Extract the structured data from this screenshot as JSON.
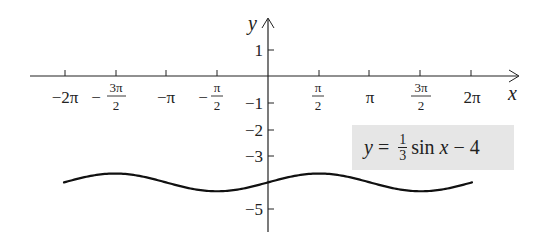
{
  "chart_data": {
    "type": "line",
    "title": "",
    "function": "y = (1/3) sin x - 4",
    "xlabel": "x",
    "ylabel": "y",
    "x_ticks": [
      "-2π",
      "-3π/2",
      "-π",
      "-π/2",
      "π/2",
      "π",
      "3π/2",
      "2π"
    ],
    "x_tick_values": [
      -6.2832,
      -4.7124,
      -3.1416,
      -1.5708,
      1.5708,
      3.1416,
      4.7124,
      6.2832
    ],
    "y_ticks": [
      "1",
      "-1",
      "-2",
      "-3",
      "-5"
    ],
    "y_tick_values": [
      1,
      -1,
      -2,
      -3,
      -5
    ],
    "xlim": [
      -6.6,
      7.5
    ],
    "ylim": [
      -5.8,
      1.7
    ],
    "grid": false,
    "series": [
      {
        "name": "y = 1/3 sin x - 4",
        "x": [
          -6.2832,
          -4.7124,
          -3.1416,
          -1.5708,
          0,
          1.5708,
          3.1416,
          4.7124,
          6.2832
        ],
        "y": [
          -4,
          -3.667,
          -4,
          -4.333,
          -4,
          -3.667,
          -4,
          -4.333,
          -4
        ],
        "color": "#111111"
      }
    ],
    "annotation": {
      "text": "y = 1/3 sin x − 4",
      "background": "#e6e6e6"
    }
  },
  "labels": {
    "x_axis": "x",
    "y_axis": "y",
    "x_ticks": [
      {
        "whole": "−2π"
      },
      {
        "sign": "−",
        "num": "3π",
        "den": "2"
      },
      {
        "whole": "−π"
      },
      {
        "sign": "−",
        "num": "π",
        "den": "2"
      },
      {
        "num": "π",
        "den": "2"
      },
      {
        "whole": "π"
      },
      {
        "num": "3π",
        "den": "2"
      },
      {
        "whole": "2π"
      }
    ],
    "y_ticks": [
      "1",
      "−1",
      "−2",
      "−3",
      "−5"
    ]
  },
  "equation": {
    "y": "y",
    "eq": " = ",
    "frac_num": "1",
    "frac_den": "3",
    "rest_fn": "sin ",
    "rest_var": "x",
    "rest_tail": " − 4"
  }
}
